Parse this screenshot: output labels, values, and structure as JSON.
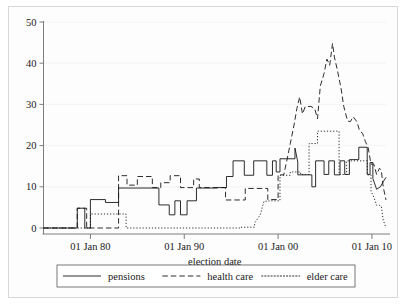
{
  "chart_data": {
    "type": "line",
    "title": "",
    "xlabel": "election date",
    "ylabel": "",
    "xlim": [
      1975.0,
      2011.5
    ],
    "ylim": [
      0,
      50
    ],
    "grid": true,
    "legend_position": "bottom",
    "x_tick_labels": [
      "01 Jan 80",
      "01 Jan 90",
      "01 Jan 00",
      "01 Jan 10"
    ],
    "x_tick_values": [
      1980,
      1990,
      2000,
      2010
    ],
    "y_tick_labels": [
      "0",
      "10",
      "20",
      "30",
      "40",
      "50"
    ],
    "y_tick_values": [
      0,
      10,
      20,
      30,
      40,
      50
    ],
    "series": [
      {
        "name": "pensions",
        "style": "solid",
        "points": [
          [
            1975.0,
            0.0
          ],
          [
            1978.6,
            0.0
          ],
          [
            1978.6,
            4.8
          ],
          [
            1979.4,
            4.8
          ],
          [
            1979.4,
            0.0
          ],
          [
            1980.0,
            0.0
          ],
          [
            1980.0,
            6.9
          ],
          [
            1981.6,
            6.9
          ],
          [
            1981.6,
            6.2
          ],
          [
            1983.0,
            6.2
          ],
          [
            1983.0,
            9.7
          ],
          [
            1987.0,
            9.7
          ],
          [
            1987.3,
            9.7
          ],
          [
            1987.3,
            5.6
          ],
          [
            1988.4,
            5.6
          ],
          [
            1988.4,
            3.2
          ],
          [
            1989.0,
            3.2
          ],
          [
            1989.0,
            6.6
          ],
          [
            1989.6,
            6.6
          ],
          [
            1989.6,
            3.2
          ],
          [
            1990.3,
            3.2
          ],
          [
            1990.3,
            6.6
          ],
          [
            1991.3,
            6.6
          ],
          [
            1991.3,
            9.7
          ],
          [
            1993.5,
            9.7
          ],
          [
            1993.5,
            9.8
          ],
          [
            1994.5,
            9.8
          ],
          [
            1994.5,
            12.5
          ],
          [
            1995.2,
            12.5
          ],
          [
            1995.2,
            16.3
          ],
          [
            1996.4,
            16.3
          ],
          [
            1996.4,
            12.8
          ],
          [
            1997.4,
            12.8
          ],
          [
            1997.4,
            16.3
          ],
          [
            1998.8,
            16.3
          ],
          [
            1998.8,
            12.8
          ],
          [
            1999.4,
            12.8
          ],
          [
            1999.4,
            16.3
          ],
          [
            1999.8,
            16.3
          ],
          [
            1999.8,
            13.6
          ],
          [
            2000.2,
            13.6
          ],
          [
            2000.2,
            16.8
          ],
          [
            2001.8,
            16.8
          ],
          [
            2001.8,
            19.4
          ],
          [
            2002.1,
            16.0
          ],
          [
            2002.1,
            12.9
          ],
          [
            2003.0,
            12.9
          ],
          [
            2003.0,
            12.9
          ],
          [
            2003.6,
            12.9
          ],
          [
            2003.6,
            10.0
          ],
          [
            2004.0,
            10.0
          ],
          [
            2004.0,
            16.3
          ],
          [
            2004.9,
            16.3
          ],
          [
            2004.9,
            13.0
          ],
          [
            2005.4,
            13.0
          ],
          [
            2005.4,
            16.3
          ],
          [
            2006.0,
            16.3
          ],
          [
            2006.0,
            12.9
          ],
          [
            2006.6,
            12.9
          ],
          [
            2006.6,
            16.3
          ],
          [
            2007.1,
            16.3
          ],
          [
            2007.1,
            13.0
          ],
          [
            2007.6,
            13.0
          ],
          [
            2007.6,
            16.6
          ],
          [
            2008.6,
            16.6
          ],
          [
            2008.6,
            19.6
          ],
          [
            2009.5,
            19.6
          ],
          [
            2009.5,
            13.0
          ],
          [
            2009.8,
            13.0
          ],
          [
            2009.8,
            15.9
          ],
          [
            2010.1,
            15.9
          ],
          [
            2010.1,
            12.0
          ],
          [
            2010.5,
            9.4
          ],
          [
            2010.9,
            10.0
          ],
          [
            2011.2,
            11.2
          ],
          [
            2011.5,
            12.3
          ]
        ]
      },
      {
        "name": "health care",
        "style": "dashed",
        "points": [
          [
            1975.0,
            0.0
          ],
          [
            1978.6,
            0.0
          ],
          [
            1978.6,
            4.8
          ],
          [
            1979.6,
            4.8
          ],
          [
            1979.6,
            0.0
          ],
          [
            1980.0,
            0.0
          ],
          [
            1980.0,
            0.0
          ],
          [
            1983.0,
            0.0
          ],
          [
            1983.0,
            12.7
          ],
          [
            1983.9,
            12.7
          ],
          [
            1983.9,
            10.4
          ],
          [
            1985.0,
            10.4
          ],
          [
            1985.0,
            12.5
          ],
          [
            1986.6,
            12.5
          ],
          [
            1986.6,
            9.8
          ],
          [
            1987.5,
            9.8
          ],
          [
            1987.5,
            11.0
          ],
          [
            1988.5,
            11.0
          ],
          [
            1988.5,
            12.7
          ],
          [
            1989.6,
            12.7
          ],
          [
            1989.6,
            9.8
          ],
          [
            1991.0,
            9.8
          ],
          [
            1991.0,
            11.9
          ],
          [
            1991.6,
            11.9
          ],
          [
            1991.6,
            9.8
          ],
          [
            1993.0,
            9.8
          ],
          [
            1993.0,
            9.8
          ],
          [
            1994.4,
            9.8
          ],
          [
            1994.4,
            6.8
          ],
          [
            1996.5,
            6.8
          ],
          [
            1996.5,
            9.6
          ],
          [
            1998.9,
            9.6
          ],
          [
            1998.9,
            6.9
          ],
          [
            2000.0,
            6.9
          ],
          [
            2000.0,
            12.9
          ],
          [
            2000.6,
            12.9
          ],
          [
            2000.9,
            16.0
          ],
          [
            2001.3,
            20.5
          ],
          [
            2001.7,
            25.0
          ],
          [
            2002.0,
            29.0
          ],
          [
            2002.3,
            31.8
          ],
          [
            2002.6,
            27.7
          ],
          [
            2002.9,
            29.5
          ],
          [
            2003.5,
            29.5
          ],
          [
            2003.9,
            29.0
          ],
          [
            2004.2,
            26.5
          ],
          [
            2004.5,
            34.5
          ],
          [
            2004.9,
            37.5
          ],
          [
            2005.2,
            41.0
          ],
          [
            2005.5,
            39.5
          ],
          [
            2005.8,
            44.8
          ],
          [
            2006.0,
            41.5
          ],
          [
            2006.3,
            38.5
          ],
          [
            2006.7,
            34.0
          ],
          [
            2007.0,
            29.5
          ],
          [
            2007.4,
            26.0
          ],
          [
            2007.7,
            25.8
          ],
          [
            2008.0,
            27.0
          ],
          [
            2008.4,
            25.8
          ],
          [
            2008.7,
            23.5
          ],
          [
            2009.0,
            23.0
          ],
          [
            2009.3,
            21.0
          ],
          [
            2009.6,
            19.5
          ],
          [
            2009.9,
            15.5
          ],
          [
            2010.2,
            15.5
          ],
          [
            2010.5,
            13.0
          ],
          [
            2010.8,
            14.5
          ],
          [
            2011.0,
            14.0
          ],
          [
            2011.2,
            10.0
          ],
          [
            2011.5,
            6.8
          ]
        ]
      },
      {
        "name": "elder care",
        "style": "dotted",
        "points": [
          [
            1975.0,
            0.0
          ],
          [
            1980.0,
            0.0
          ],
          [
            1980.0,
            3.4
          ],
          [
            1983.8,
            3.4
          ],
          [
            1983.8,
            0.0
          ],
          [
            1984.6,
            0.0
          ],
          [
            1984.6,
            0.0
          ],
          [
            1996.0,
            0.0
          ],
          [
            1996.0,
            0.2
          ],
          [
            1997.5,
            0.2
          ],
          [
            1997.5,
            1.2
          ],
          [
            1998.1,
            3.2
          ],
          [
            1998.5,
            6.5
          ],
          [
            1999.0,
            6.5
          ],
          [
            1999.0,
            6.6
          ],
          [
            2000.2,
            6.6
          ],
          [
            2000.2,
            12.8
          ],
          [
            2001.3,
            12.8
          ],
          [
            2001.3,
            13.6
          ],
          [
            2002.4,
            13.6
          ],
          [
            2002.4,
            13.0
          ],
          [
            2003.3,
            13.0
          ],
          [
            2003.3,
            20.5
          ],
          [
            2004.2,
            20.5
          ],
          [
            2004.2,
            23.5
          ],
          [
            2006.5,
            23.5
          ],
          [
            2006.5,
            13.0
          ],
          [
            2007.3,
            13.0
          ],
          [
            2007.3,
            16.3
          ],
          [
            2009.5,
            16.3
          ],
          [
            2009.5,
            12.9
          ],
          [
            2009.9,
            12.9
          ],
          [
            2009.9,
            9.0
          ],
          [
            2010.2,
            7.5
          ],
          [
            2010.5,
            5.5
          ],
          [
            2010.8,
            5.5
          ],
          [
            2011.0,
            5.3
          ],
          [
            2011.2,
            2.0
          ],
          [
            2011.5,
            0.0
          ]
        ]
      }
    ]
  },
  "legend": {
    "items": [
      {
        "label": "pensions",
        "style": "solid"
      },
      {
        "label": "health care",
        "style": "dashed"
      },
      {
        "label": "elder care",
        "style": "dotted"
      }
    ]
  },
  "colors": {
    "line": "#151515",
    "axis": "#6f6f6f",
    "grid": "#eef0f2",
    "background": "#ffffff",
    "frame": "#d8d8d8"
  }
}
